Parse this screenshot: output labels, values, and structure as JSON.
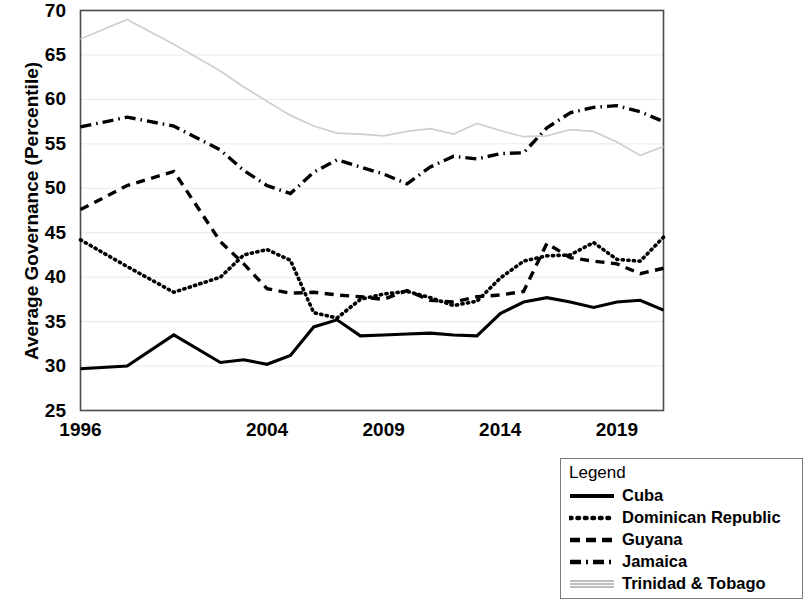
{
  "chart_data": {
    "type": "line",
    "title": "",
    "xlabel": "",
    "ylabel": "Average Governance (Percentile)",
    "ylim": [
      25,
      70
    ],
    "ytick_labels": [
      "25",
      "30",
      "35",
      "40",
      "45",
      "50",
      "55",
      "60",
      "65",
      "70"
    ],
    "ytick_values": [
      25,
      30,
      35,
      40,
      45,
      50,
      55,
      60,
      65,
      70
    ],
    "xtick_labels": [
      "1996",
      "2004",
      "2009",
      "2014",
      "2019"
    ],
    "xtick_values": [
      1996,
      2004,
      2009,
      2014,
      2019
    ],
    "x": [
      1996,
      1998,
      2000,
      2002,
      2003,
      2004,
      2005,
      2006,
      2007,
      2008,
      2009,
      2010,
      2011,
      2012,
      2013,
      2014,
      2015,
      2016,
      2017,
      2018,
      2019,
      2020,
      2021
    ],
    "grid": "horizontal",
    "legend_position": "bottom-right",
    "series": [
      {
        "name": "Cuba",
        "style": "solid",
        "color": "#000000",
        "values": [
          29.7,
          30.0,
          33.5,
          30.4,
          30.7,
          30.2,
          31.2,
          34.4,
          35.2,
          33.4,
          33.5,
          33.6,
          33.7,
          33.5,
          33.4,
          35.9,
          37.2,
          37.7,
          37.2,
          36.6,
          37.2,
          37.4,
          36.3
        ]
      },
      {
        "name": "Dominican Republic",
        "style": "dotted",
        "color": "#000000",
        "values": [
          44.2,
          41.2,
          38.3,
          40.0,
          42.5,
          43.1,
          41.9,
          36.0,
          35.4,
          37.5,
          38.1,
          38.4,
          37.7,
          36.8,
          37.3,
          39.9,
          41.8,
          42.4,
          42.5,
          43.9,
          42.0,
          41.8,
          44.5
        ]
      },
      {
        "name": "Guyana",
        "style": "dashed",
        "color": "#000000",
        "values": [
          47.6,
          50.3,
          51.9,
          44.0,
          41.5,
          38.7,
          38.2,
          38.3,
          38.0,
          37.8,
          37.5,
          38.5,
          37.4,
          37.2,
          37.8,
          38.0,
          38.4,
          43.8,
          42.2,
          41.8,
          41.5,
          40.4,
          41.0
        ]
      },
      {
        "name": "Jamaica",
        "style": "dashdot",
        "color": "#000000",
        "values": [
          56.9,
          58.0,
          57.0,
          54.3,
          52.0,
          50.3,
          49.4,
          51.8,
          53.2,
          52.4,
          51.6,
          50.5,
          52.4,
          53.6,
          53.3,
          53.9,
          54.0,
          56.8,
          58.5,
          59.1,
          59.3,
          58.6,
          57.5
        ]
      },
      {
        "name": "Trinidad & Tobago",
        "style": "light-solid",
        "color": "#cfcfcf",
        "values": [
          66.8,
          69.0,
          66.2,
          63.2,
          61.4,
          59.8,
          58.2,
          57.0,
          56.2,
          56.1,
          55.9,
          56.4,
          56.7,
          56.1,
          57.3,
          56.5,
          55.8,
          55.9,
          56.6,
          56.4,
          55.2,
          53.7,
          54.7
        ]
      }
    ]
  },
  "axis": {
    "ylabel": "Average Governance (Percentile)"
  },
  "legend": {
    "title": "Legend",
    "items": [
      {
        "label": "Cuba",
        "style": "solid"
      },
      {
        "label": "Dominican Republic",
        "style": "dotted"
      },
      {
        "label": "Guyana",
        "style": "dashed"
      },
      {
        "label": "Jamaica",
        "style": "dashdot"
      },
      {
        "label": "Trinidad & Tobago",
        "style": "light-solid"
      }
    ]
  }
}
